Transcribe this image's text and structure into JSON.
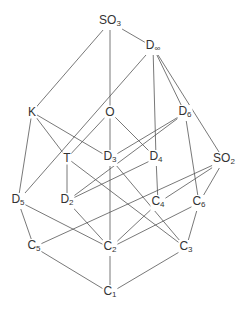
{
  "diagram": {
    "title": "",
    "type": "subgroup lattice",
    "line_color": "#555555",
    "text_color": "#333333",
    "nodes": [
      {
        "id": "SO3",
        "base": "SO",
        "sub": "3",
        "x": 110,
        "y": 22
      },
      {
        "id": "Dinf",
        "base": "D",
        "sub": "∞",
        "x": 153,
        "y": 47
      },
      {
        "id": "K",
        "base": "K",
        "sub": "",
        "x": 32,
        "y": 112
      },
      {
        "id": "O",
        "base": "O",
        "sub": "",
        "x": 110,
        "y": 112
      },
      {
        "id": "D6",
        "base": "D",
        "sub": "6",
        "x": 185,
        "y": 113
      },
      {
        "id": "T",
        "base": "T",
        "sub": "",
        "x": 67,
        "y": 158
      },
      {
        "id": "D3",
        "base": "D",
        "sub": "3",
        "x": 110,
        "y": 158
      },
      {
        "id": "D4",
        "base": "D",
        "sub": "4",
        "x": 156,
        "y": 158
      },
      {
        "id": "SO2",
        "base": "SO",
        "sub": "2",
        "x": 224,
        "y": 160
      },
      {
        "id": "D5",
        "base": "D",
        "sub": "5",
        "x": 18,
        "y": 201
      },
      {
        "id": "D2",
        "base": "D",
        "sub": "2",
        "x": 67,
        "y": 201
      },
      {
        "id": "C4",
        "base": "C",
        "sub": "4",
        "x": 158,
        "y": 203
      },
      {
        "id": "C6",
        "base": "C",
        "sub": "6",
        "x": 199,
        "y": 203
      },
      {
        "id": "C5",
        "base": "C",
        "sub": "5",
        "x": 34,
        "y": 247
      },
      {
        "id": "C2",
        "base": "C",
        "sub": "2",
        "x": 110,
        "y": 248
      },
      {
        "id": "C3",
        "base": "C",
        "sub": "3",
        "x": 186,
        "y": 248
      },
      {
        "id": "C1",
        "base": "C",
        "sub": "1",
        "x": 110,
        "y": 293
      }
    ],
    "edges": [
      [
        "SO3",
        "K"
      ],
      [
        "SO3",
        "O"
      ],
      [
        "SO3",
        "Dinf"
      ],
      [
        "Dinf",
        "D5"
      ],
      [
        "Dinf",
        "D4"
      ],
      [
        "Dinf",
        "D6"
      ],
      [
        "Dinf",
        "SO2"
      ],
      [
        "K",
        "T"
      ],
      [
        "K",
        "D3"
      ],
      [
        "K",
        "D5"
      ],
      [
        "O",
        "T"
      ],
      [
        "O",
        "D3"
      ],
      [
        "O",
        "D4"
      ],
      [
        "D6",
        "D3"
      ],
      [
        "D6",
        "D2"
      ],
      [
        "D6",
        "C6"
      ],
      [
        "T",
        "D2"
      ],
      [
        "T",
        "C3"
      ],
      [
        "D3",
        "C2"
      ],
      [
        "D3",
        "C3"
      ],
      [
        "D4",
        "D2"
      ],
      [
        "D4",
        "C4"
      ],
      [
        "SO2",
        "C5"
      ],
      [
        "SO2",
        "C4"
      ],
      [
        "SO2",
        "C6"
      ],
      [
        "D5",
        "C5"
      ],
      [
        "D5",
        "C2"
      ],
      [
        "D2",
        "C2"
      ],
      [
        "C4",
        "C2"
      ],
      [
        "C6",
        "C2"
      ],
      [
        "C6",
        "C3"
      ],
      [
        "C5",
        "C1"
      ],
      [
        "C2",
        "C1"
      ],
      [
        "C3",
        "C1"
      ]
    ]
  }
}
